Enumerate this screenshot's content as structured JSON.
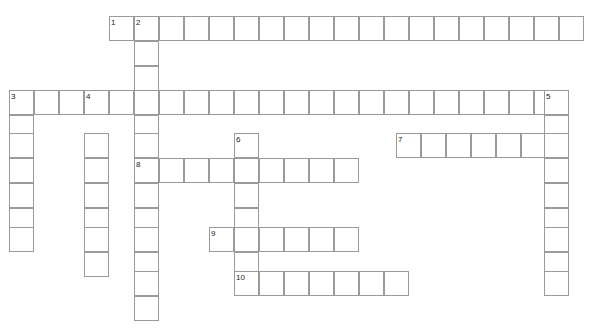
{
  "page": {
    "watermark": "",
    "width": 601,
    "height": 329,
    "background_color": "#ffffff",
    "cell_border_color": "#9a9a9a",
    "cell_fill_color": "#ffffff",
    "number_color": "#1a1a1a",
    "cell_size": 25
  },
  "grid": {
    "origin_x": 9,
    "origin_y": 16,
    "cell_size": 25,
    "columns": 24,
    "rows": 13
  },
  "entries": [
    {
      "number": "1",
      "direction": "across",
      "start_col": 4,
      "start_row": 0,
      "length": 19,
      "answer_cells": 19
    },
    {
      "number": "2",
      "direction": "down",
      "start_col": 5,
      "start_row": 0,
      "length": 12,
      "answer_cells": 12
    },
    {
      "number": "3",
      "direction": "across",
      "start_col": 0,
      "start_row": 3,
      "length": 23,
      "answer_cells": 23
    },
    {
      "number": "3",
      "direction": "down",
      "start_col": 0,
      "start_row": 3,
      "length": 7,
      "answer_cells": 7
    },
    {
      "number": "4",
      "direction": "down",
      "start_col": 3,
      "start_row": 3,
      "length": 8,
      "answer_cells": 8
    },
    {
      "number": "5",
      "direction": "down",
      "start_col": 22,
      "start_row": 3,
      "length": 8,
      "answer_cells": 8
    },
    {
      "number": "6",
      "direction": "down",
      "start_col": 9,
      "start_row": 5,
      "length": 7,
      "answer_cells": 7
    },
    {
      "number": "7",
      "direction": "across",
      "start_col": 16,
      "start_row": 5,
      "length": 7,
      "answer_cells": 7
    },
    {
      "number": "8",
      "direction": "across",
      "start_col": 5,
      "start_row": 6,
      "length": 9,
      "answer_cells": 9
    },
    {
      "number": "9",
      "direction": "across",
      "start_col": 8,
      "start_row": 8,
      "length": 6,
      "answer_cells": 6
    },
    {
      "number": "10",
      "direction": "across",
      "start_col": 9,
      "start_row": 10,
      "length": 7,
      "answer_cells": 7
    }
  ],
  "cells": [
    {
      "x": 109,
      "y": 16
    },
    {
      "x": 134,
      "y": 16
    },
    {
      "x": 159,
      "y": 16
    },
    {
      "x": 184,
      "y": 16
    },
    {
      "x": 209,
      "y": 16
    },
    {
      "x": 234,
      "y": 16
    },
    {
      "x": 259,
      "y": 16
    },
    {
      "x": 284,
      "y": 16
    },
    {
      "x": 309,
      "y": 16
    },
    {
      "x": 334,
      "y": 16
    },
    {
      "x": 359,
      "y": 16
    },
    {
      "x": 384,
      "y": 16
    },
    {
      "x": 409,
      "y": 16
    },
    {
      "x": 434,
      "y": 16
    },
    {
      "x": 459,
      "y": 16
    },
    {
      "x": 484,
      "y": 16
    },
    {
      "x": 509,
      "y": 16
    },
    {
      "x": 534,
      "y": 16
    },
    {
      "x": 559,
      "y": 16
    },
    {
      "x": 134,
      "y": 41
    },
    {
      "x": 134,
      "y": 66
    },
    {
      "x": 9,
      "y": 90
    },
    {
      "x": 34,
      "y": 90
    },
    {
      "x": 59,
      "y": 90
    },
    {
      "x": 84,
      "y": 90
    },
    {
      "x": 109,
      "y": 90
    },
    {
      "x": 134,
      "y": 90
    },
    {
      "x": 159,
      "y": 90
    },
    {
      "x": 184,
      "y": 90
    },
    {
      "x": 209,
      "y": 90
    },
    {
      "x": 234,
      "y": 90
    },
    {
      "x": 259,
      "y": 90
    },
    {
      "x": 284,
      "y": 90
    },
    {
      "x": 309,
      "y": 90
    },
    {
      "x": 334,
      "y": 90
    },
    {
      "x": 359,
      "y": 90
    },
    {
      "x": 384,
      "y": 90
    },
    {
      "x": 409,
      "y": 90
    },
    {
      "x": 434,
      "y": 90
    },
    {
      "x": 459,
      "y": 90
    },
    {
      "x": 484,
      "y": 90
    },
    {
      "x": 509,
      "y": 90
    },
    {
      "x": 534,
      "y": 90
    },
    {
      "x": 544,
      "y": 90
    },
    {
      "x": 9,
      "y": 115
    },
    {
      "x": 134,
      "y": 115
    },
    {
      "x": 544,
      "y": 115
    },
    {
      "x": 9,
      "y": 133
    },
    {
      "x": 84,
      "y": 133
    },
    {
      "x": 134,
      "y": 133
    },
    {
      "x": 234,
      "y": 133
    },
    {
      "x": 396,
      "y": 133
    },
    {
      "x": 421,
      "y": 133
    },
    {
      "x": 446,
      "y": 133
    },
    {
      "x": 471,
      "y": 133
    },
    {
      "x": 496,
      "y": 133
    },
    {
      "x": 521,
      "y": 133
    },
    {
      "x": 544,
      "y": 133
    },
    {
      "x": 134,
      "y": 158
    },
    {
      "x": 159,
      "y": 158
    },
    {
      "x": 184,
      "y": 158
    },
    {
      "x": 209,
      "y": 158
    },
    {
      "x": 234,
      "y": 158
    },
    {
      "x": 259,
      "y": 158
    },
    {
      "x": 284,
      "y": 158
    },
    {
      "x": 309,
      "y": 158
    },
    {
      "x": 334,
      "y": 158
    },
    {
      "x": 9,
      "y": 158
    },
    {
      "x": 84,
      "y": 158
    },
    {
      "x": 544,
      "y": 158
    },
    {
      "x": 9,
      "y": 183
    },
    {
      "x": 84,
      "y": 183
    },
    {
      "x": 134,
      "y": 183
    },
    {
      "x": 234,
      "y": 183
    },
    {
      "x": 544,
      "y": 183
    },
    {
      "x": 9,
      "y": 208
    },
    {
      "x": 84,
      "y": 208
    },
    {
      "x": 134,
      "y": 208
    },
    {
      "x": 234,
      "y": 208
    },
    {
      "x": 544,
      "y": 208
    },
    {
      "x": 209,
      "y": 227
    },
    {
      "x": 234,
      "y": 227
    },
    {
      "x": 259,
      "y": 227
    },
    {
      "x": 284,
      "y": 227
    },
    {
      "x": 309,
      "y": 227
    },
    {
      "x": 334,
      "y": 227
    },
    {
      "x": 9,
      "y": 227
    },
    {
      "x": 84,
      "y": 227
    },
    {
      "x": 134,
      "y": 227
    },
    {
      "x": 544,
      "y": 227
    },
    {
      "x": 84,
      "y": 252
    },
    {
      "x": 134,
      "y": 252
    },
    {
      "x": 234,
      "y": 252
    },
    {
      "x": 544,
      "y": 252
    },
    {
      "x": 234,
      "y": 271
    },
    {
      "x": 259,
      "y": 271
    },
    {
      "x": 284,
      "y": 271
    },
    {
      "x": 309,
      "y": 271
    },
    {
      "x": 334,
      "y": 271
    },
    {
      "x": 359,
      "y": 271
    },
    {
      "x": 384,
      "y": 271
    },
    {
      "x": 134,
      "y": 271
    },
    {
      "x": 544,
      "y": 271
    },
    {
      "x": 134,
      "y": 296
    }
  ],
  "numbers": [
    {
      "label": "1",
      "x": 111,
      "y": 19
    },
    {
      "label": "2",
      "x": 136,
      "y": 19
    },
    {
      "label": "3",
      "x": 11,
      "y": 93
    },
    {
      "label": "4",
      "x": 86,
      "y": 93
    },
    {
      "label": "5",
      "x": 546,
      "y": 93
    },
    {
      "label": "6",
      "x": 236,
      "y": 136
    },
    {
      "label": "7",
      "x": 398,
      "y": 136
    },
    {
      "label": "8",
      "x": 136,
      "y": 161
    },
    {
      "label": "9",
      "x": 211,
      "y": 230
    },
    {
      "label": "10",
      "x": 236,
      "y": 274
    }
  ]
}
